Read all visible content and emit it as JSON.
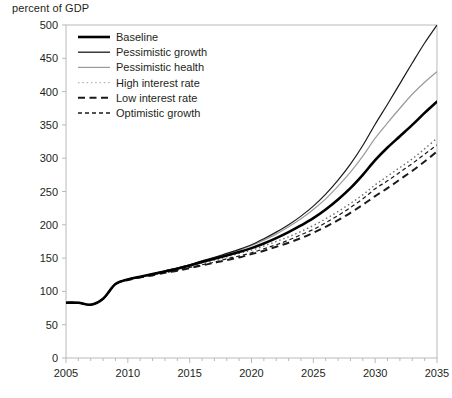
{
  "chart_data": {
    "type": "line",
    "title": "percent of GDP",
    "xlabel": "",
    "ylabel": "",
    "xlim": [
      2005,
      2035
    ],
    "ylim": [
      0,
      500
    ],
    "ytick_step": 50,
    "xtick_step": 5,
    "grid": false,
    "legend_position": "top-left inside plot",
    "yticks": [
      "0",
      "50",
      "100",
      "150",
      "200",
      "250",
      "300",
      "350",
      "400",
      "450",
      "500"
    ],
    "xticks": [
      "2005",
      "2010",
      "2015",
      "2020",
      "2025",
      "2030",
      "2035"
    ],
    "x": [
      2005,
      2006,
      2007,
      2008,
      2009,
      2010,
      2011,
      2012,
      2013,
      2014,
      2015,
      2016,
      2017,
      2018,
      2019,
      2020,
      2021,
      2022,
      2023,
      2024,
      2025,
      2026,
      2027,
      2028,
      2029,
      2030,
      2031,
      2032,
      2033,
      2034,
      2035
    ],
    "series": [
      {
        "name": "Baseline",
        "style": "solid",
        "width": 2.6,
        "color": "#000000",
        "values": [
          83,
          83,
          80,
          89,
          111,
          118,
          122,
          126,
          130,
          134,
          139,
          144,
          149,
          154,
          159,
          165,
          172,
          180,
          189,
          199,
          210,
          223,
          238,
          255,
          275,
          297,
          316,
          333,
          350,
          368,
          385
        ]
      },
      {
        "name": "Pessimistic growth",
        "style": "solid",
        "width": 1.2,
        "color": "#1a1a1a",
        "values": [
          83,
          83,
          80,
          89,
          111,
          118,
          122,
          126,
          131,
          135,
          140,
          146,
          151,
          157,
          163,
          170,
          179,
          189,
          200,
          213,
          228,
          246,
          267,
          291,
          319,
          351,
          381,
          412,
          443,
          473,
          500
        ]
      },
      {
        "name": "Pessimistic health",
        "style": "solid",
        "width": 1.2,
        "color": "#9a9a9a",
        "values": [
          83,
          83,
          80,
          89,
          111,
          118,
          122,
          126,
          130,
          135,
          140,
          145,
          150,
          156,
          162,
          169,
          177,
          186,
          197,
          209,
          223,
          239,
          258,
          279,
          303,
          330,
          353,
          375,
          396,
          414,
          430
        ]
      },
      {
        "name": "High interest rate",
        "style": "dotted",
        "width": 1.4,
        "color": "#6e6e6e",
        "values": [
          83,
          83,
          80,
          89,
          111,
          118,
          122,
          126,
          130,
          134,
          138,
          143,
          147,
          152,
          157,
          162,
          168,
          175,
          182,
          190,
          199,
          209,
          220,
          232,
          245,
          260,
          273,
          286,
          299,
          314,
          330
        ]
      },
      {
        "name": "Low interest rate",
        "style": "dashed-long",
        "width": 2.0,
        "color": "#1a1a1a",
        "values": [
          83,
          83,
          80,
          89,
          111,
          117,
          121,
          124,
          128,
          131,
          135,
          139,
          143,
          147,
          151,
          156,
          161,
          167,
          173,
          180,
          188,
          197,
          207,
          218,
          230,
          243,
          255,
          268,
          281,
          295,
          310
        ]
      },
      {
        "name": "Optimistic growth",
        "style": "dashed-short",
        "width": 1.2,
        "color": "#1a1a1a",
        "values": [
          83,
          83,
          80,
          89,
          111,
          117,
          121,
          125,
          128,
          132,
          136,
          140,
          144,
          149,
          153,
          158,
          164,
          170,
          177,
          185,
          193,
          203,
          214,
          226,
          239,
          254,
          266,
          279,
          292,
          306,
          320
        ]
      }
    ],
    "legend": [
      {
        "label": "Baseline",
        "style": "solid",
        "width": 2.6,
        "color": "#000000"
      },
      {
        "label": "Pessimistic growth",
        "style": "solid",
        "width": 1.3,
        "color": "#1a1a1a"
      },
      {
        "label": "Pessimistic health",
        "style": "solid",
        "width": 1.2,
        "color": "#9a9a9a"
      },
      {
        "label": "High interest rate",
        "style": "dotted",
        "width": 1.4,
        "color": "#b5b5b5"
      },
      {
        "label": "Low interest rate",
        "style": "dashed-long",
        "width": 2.0,
        "color": "#1a1a1a"
      },
      {
        "label": "Optimistic growth",
        "style": "dashed-short",
        "width": 1.6,
        "color": "#1a1a1a"
      }
    ],
    "colors": {
      "axis": "#b9b9b9",
      "text": "#231f20",
      "baseline": "#000000",
      "pessimistic_health": "#9a9a9a",
      "high_interest_rate": "#6e6e6e"
    }
  }
}
